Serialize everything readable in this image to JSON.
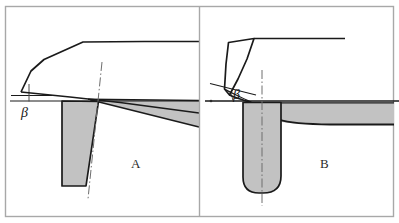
{
  "figure": {
    "type": "technical-diagram",
    "background_color": "#ffffff",
    "border_color": "#a8a8a8",
    "line_color": "#1a1a1a",
    "fill_gray": "#c2c2c2",
    "centerline_color": "#6e6e6e",
    "panel_divider_x": 199
  },
  "panels": [
    {
      "id": "A",
      "label": "A",
      "label_x": 131,
      "label_y": 166,
      "angle": {
        "symbol": "β",
        "label_x": 21,
        "label_y": 114,
        "description": "small rake/shear reference angle below horizontal datum"
      },
      "description": "tapered straight tool wedge with long flat chip and wedge-shaped workpiece widening to the right"
    },
    {
      "id": "B",
      "label": "B",
      "label_x": 320,
      "label_y": 166,
      "angle": {
        "symbol": "β",
        "label_x": 237,
        "label_y": 100,
        "description": "large rake/shear reference angle above horizontal datum"
      },
      "description": "round-nosed tool with short curled chip and concave machined workpiece surface"
    }
  ],
  "geometry": {
    "outer_border": {
      "x": 5,
      "y": 6,
      "width": 389,
      "height": 211
    },
    "panelA": {
      "chip_outline": "M 22,92 L 30,72 L 43,60 L 82,42 L 143,42 L 199,42",
      "chip_lower_edge": "M 22,92 L 90,100 L 199,113",
      "datum_line": "M 10,101 L 199,101",
      "workpiece_top": "M 90,100 L 199,101",
      "workpiece": "M 90,100 L 199,101 L 199,126 L 90,100 Z",
      "workpiece_lower": "M 90,100 L 199,126",
      "tool": "M 62,101 L 98,101 L 86,186 L 62,186 Z",
      "tool_center": "M 101,63 L 88,198",
      "tick_vertical": "M 29,83 L 29,101",
      "angle_arm": "M 10,96 L 46,96"
    },
    "panelB": {
      "chip_outline": "M 228,43 L 253,39 L 246,60 L 236,82 L 228,96 L 224,90 L 228,66 Z",
      "chip_top_line": "M 253,39 L 345,39",
      "chip_curl": "M 228,96 L 239,99 L 253,105",
      "datum_line": "M 205,101 L 399,101",
      "angle_arm": "M 211,84 L 262,96",
      "workpiece_top": "M 253,103 L 399,103",
      "workpiece_fill": "M 253,103 L 399,103 L 399,124 L 275,124 L 262,112 L 253,103 Z",
      "machined_curve": "M 253,104 C 272,122 300,124 399,124",
      "tool": "M 243,103 L 280,103 L 280,178 Q 280,193 264,193 L 258,193 Q 243,193 243,178 Z",
      "tool_top": "M 243,103 L 280,103",
      "tool_center": "M 262,70 L 262,205"
    }
  }
}
